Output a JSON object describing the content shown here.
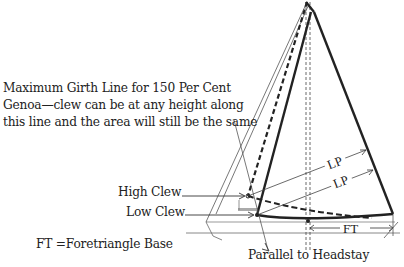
{
  "diagram": {
    "caption_lines": [
      "Maximum Girth Line for 150 Per Cent",
      "Genoa—clew can be at any height along",
      "this line and the area will still be the same"
    ],
    "labels": {
      "high_clew": "High Clew",
      "low_clew": "Low Clew",
      "ft_legend": "FT =Foretriangle Base",
      "parallel_to_headstay": "Parallel to Headstay",
      "lp_upper": "LP",
      "lp_lower": "LP",
      "ft_dimension": "FT"
    },
    "colors": {
      "line": "#222222",
      "thin_line": "#555555",
      "deck": "#999999"
    }
  }
}
